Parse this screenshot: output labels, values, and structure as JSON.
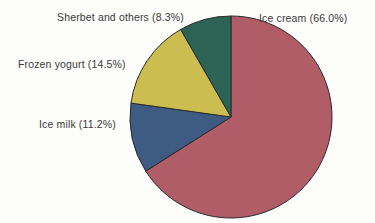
{
  "background_color": "#fdfdfc",
  "text_color": "#3a3a3a",
  "chart_data": {
    "type": "pie",
    "title": "",
    "subtitle": "",
    "xlabel": "",
    "ylabel": "",
    "legend_position": "none",
    "grid": false,
    "start_angle_deg": 0,
    "direction": "clockwise",
    "center": {
      "x": 231,
      "y": 117
    },
    "radius": 101,
    "categories": [
      "Ice cream",
      "Ice milk",
      "Frozen yogurt",
      "Sherbet and others"
    ],
    "values": [
      66.0,
      11.2,
      14.5,
      8.3
    ],
    "unit": "%",
    "colors": [
      "#b05d67",
      "#3e5b84",
      "#cbbd4f",
      "#2d6355"
    ],
    "slice_edge_color": "#2a2a2a",
    "labels": [
      {
        "name": "ice-cream",
        "category": "Ice cream",
        "value": 66.0,
        "text": "Ice cream (66.0%)"
      },
      {
        "name": "ice-milk",
        "category": "Ice milk",
        "value": 11.2,
        "text": "Ice milk (11.2%)"
      },
      {
        "name": "frozen-yogurt",
        "category": "Frozen yogurt",
        "value": 14.5,
        "text": "Frozen yogurt (14.5%)"
      },
      {
        "name": "sherbet-and-others",
        "category": "Sherbet and others",
        "value": 8.3,
        "text": "Sherbet and others (8.3%)"
      }
    ]
  }
}
